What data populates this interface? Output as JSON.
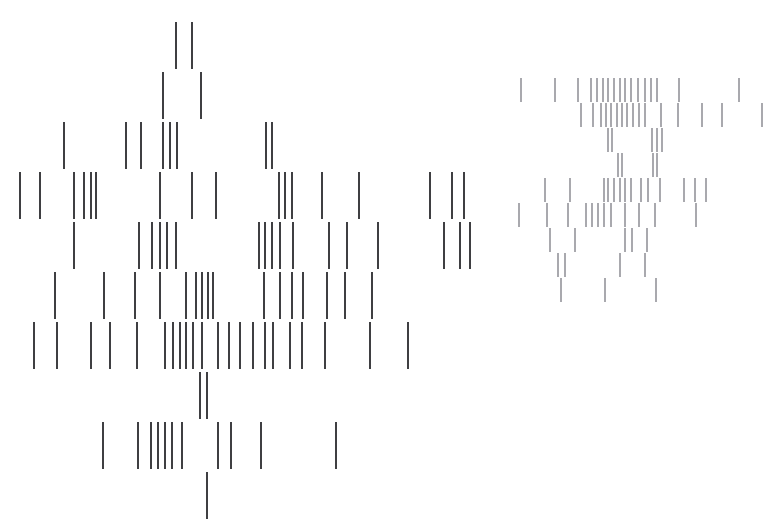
{
  "figure": {
    "title": "",
    "background_color": "#ffffff",
    "width": 764,
    "height": 532
  },
  "chart_data": {
    "type": "scatter",
    "render_style": "vertical-tick-raster",
    "title": "",
    "subtitle": "",
    "xlabel": "",
    "ylabel": "",
    "xlim": [
      0,
      764
    ],
    "ylim": [
      0,
      532
    ],
    "grid": false,
    "axes_visible": false,
    "tick_labels_visible": false,
    "legend": null,
    "legend_position": "none",
    "annotations": [],
    "series": [
      {
        "name": "cluster-a",
        "color": "#3f3f42",
        "line_width": 1.6,
        "tick_height": 47,
        "row_pitch": 50,
        "rows": [
          {
            "y": 22,
            "x": [
              176,
              192
            ]
          },
          {
            "y": 72,
            "x": [
              163,
              201
            ]
          },
          {
            "y": 122,
            "x": [
              64,
              126,
              141,
              163,
              170,
              177,
              266,
              272
            ]
          },
          {
            "y": 172,
            "x": [
              20,
              40,
              74,
              84,
              91,
              96,
              160,
              192,
              216,
              279,
              285,
              292,
              322,
              359,
              430,
              452,
              464
            ]
          },
          {
            "y": 222,
            "x": [
              74,
              139,
              152,
              160,
              167,
              176,
              259,
              265,
              272,
              280,
              293,
              329,
              347,
              378,
              444,
              460,
              470
            ]
          },
          {
            "y": 272,
            "x": [
              55,
              104,
              135,
              160,
              186,
              196,
              202,
              208,
              213,
              264,
              280,
              292,
              303,
              327,
              345,
              372
            ]
          },
          {
            "y": 322,
            "x": [
              34,
              57,
              91,
              110,
              137,
              165,
              173,
              180,
              186,
              193,
              202,
              218,
              229,
              240,
              253,
              265,
              273,
              290,
              302,
              325,
              370,
              408
            ]
          },
          {
            "y": 372,
            "x": [
              200,
              207
            ]
          },
          {
            "y": 422,
            "x": [
              103,
              138,
              151,
              158,
              165,
              172,
              182,
              218,
              231,
              261,
              336
            ]
          },
          {
            "y": 472,
            "x": [
              207
            ]
          }
        ]
      },
      {
        "name": "cluster-b",
        "color": "#a9a9ae",
        "line_width": 1.4,
        "tick_height": 24,
        "row_pitch": 25,
        "rows": [
          {
            "y": 78,
            "x": [
              521,
              555,
              578,
              591,
              597,
              603,
              608,
              614,
              620,
              625,
              631,
              638,
              645,
              651,
              657,
              679,
              739
            ]
          },
          {
            "y": 103,
            "x": [
              581,
              593,
              601,
              606,
              611,
              617,
              622,
              627,
              633,
              639,
              645,
              661,
              678,
              702,
              722,
              762
            ]
          },
          {
            "y": 128,
            "x": [
              608,
              612,
              652,
              657,
              662
            ]
          },
          {
            "y": 153,
            "x": [
              618,
              622,
              653,
              657
            ]
          },
          {
            "y": 178,
            "x": [
              545,
              570,
              604,
              608,
              614,
              620,
              625,
              631,
              641,
              648,
              660,
              684,
              695,
              706
            ]
          },
          {
            "y": 203,
            "x": [
              519,
              547,
              568,
              586,
              592,
              598,
              604,
              611,
              625,
              639,
              655,
              696
            ]
          },
          {
            "y": 228,
            "x": [
              550,
              575,
              625,
              632,
              647
            ]
          },
          {
            "y": 253,
            "x": [
              558,
              565,
              620,
              645
            ]
          },
          {
            "y": 278,
            "x": [
              561,
              605,
              656
            ]
          }
        ]
      }
    ]
  }
}
